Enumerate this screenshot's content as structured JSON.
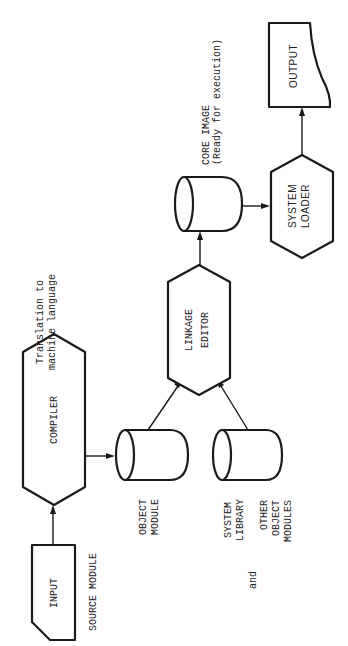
{
  "diagram": {
    "orientation": "rotated-90-ccw",
    "colors": {
      "stroke": "#1a1a1a",
      "background": "#ffffff",
      "text": "#222222"
    },
    "nodes": {
      "input": {
        "label": "INPUT",
        "shape": "card",
        "caption": "SOURCE MODULE"
      },
      "compiler": {
        "label": "COMPILER",
        "shape": "hexagon",
        "note_line1": "Translation to",
        "note_line2": "machine language"
      },
      "object_module": {
        "label_line1": "OBJECT",
        "label_line2": "MODULE",
        "shape": "cylinder"
      },
      "system_library": {
        "label_line1": "SYSTEM",
        "label_line2": "LIBRARY",
        "conjunction": "and",
        "other_line1": "OTHER",
        "other_line2": "OBJECT",
        "other_line3": "MODULES",
        "shape": "cylinder"
      },
      "linkage_editor": {
        "label_line1": "LINKAGE",
        "label_line2": "EDITOR",
        "shape": "hexagon"
      },
      "core_image": {
        "label_line1": "CORE IMAGE",
        "label_line2": "(Ready for execution)",
        "shape": "cylinder"
      },
      "system_loader": {
        "label_line1": "SYSTEM",
        "label_line2": "LOADER",
        "shape": "hexagon"
      },
      "output": {
        "label": "OUTPUT",
        "shape": "document"
      }
    },
    "edges": [
      {
        "from": "input",
        "to": "compiler"
      },
      {
        "from": "compiler",
        "to": "object_module"
      },
      {
        "from": "object_module",
        "to": "linkage_editor"
      },
      {
        "from": "system_library",
        "to": "linkage_editor"
      },
      {
        "from": "linkage_editor",
        "to": "core_image"
      },
      {
        "from": "core_image",
        "to": "system_loader"
      },
      {
        "from": "system_loader",
        "to": "output"
      }
    ]
  }
}
